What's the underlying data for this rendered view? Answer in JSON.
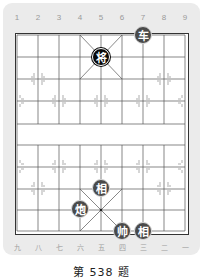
{
  "board": {
    "top_labels": [
      "1",
      "2",
      "3",
      "4",
      "5",
      "6",
      "7",
      "8",
      "9"
    ],
    "bottom_labels": [
      "九",
      "八",
      "七",
      "六",
      "五",
      "四",
      "三",
      "二",
      "一"
    ],
    "colors": {
      "red_piece": "#4a4a4a",
      "black_piece": "#0a0a0a",
      "board_bg": "#ffffff",
      "panel_bg": "#ebebeb",
      "grid_line": "#555555"
    }
  },
  "pieces": [
    {
      "char": "车",
      "side": "red",
      "col": 7,
      "row": 0
    },
    {
      "char": "将",
      "side": "black",
      "col": 5,
      "row": 1
    },
    {
      "char": "相",
      "side": "red",
      "col": 5,
      "row": 7
    },
    {
      "char": "炮",
      "side": "red",
      "col": 4,
      "row": 8
    },
    {
      "char": "帅",
      "side": "red",
      "col": 6,
      "row": 9
    },
    {
      "char": "相",
      "side": "red",
      "col": 7,
      "row": 9
    }
  ],
  "caption": "第 538 题"
}
